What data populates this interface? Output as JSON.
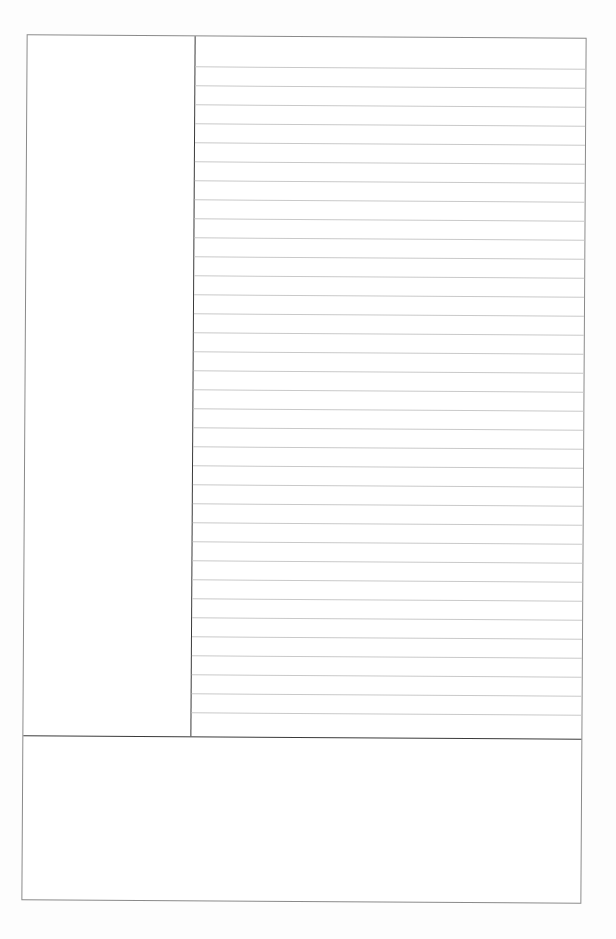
{
  "document": {
    "type": "cornell-notes-template",
    "sections": {
      "cue_column": {
        "label": "",
        "content": ""
      },
      "notes_area": {
        "label": "",
        "ruled_lines": 35,
        "line_spacing_px": 19,
        "content": ""
      },
      "summary_area": {
        "label": "",
        "content": ""
      }
    },
    "colors": {
      "border": "#8a8a8a",
      "divider": "#3a3a3a",
      "rule": "#c9c9c9",
      "paper": "#ffffff"
    }
  }
}
